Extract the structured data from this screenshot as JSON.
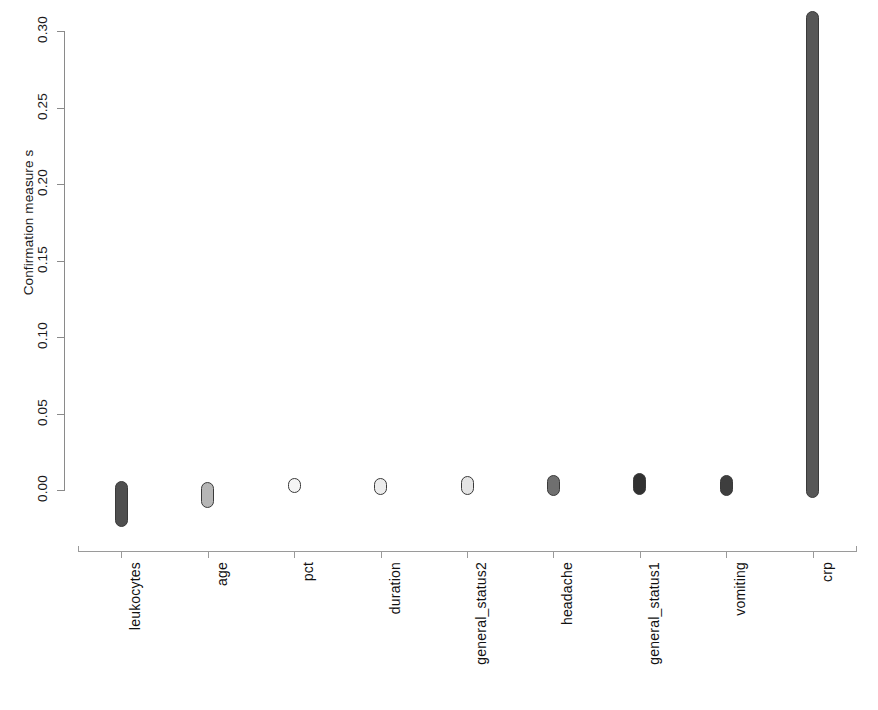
{
  "chart_data": {
    "type": "bar",
    "title": "",
    "subtitle": "",
    "xlabel": "",
    "ylabel": "Confirmation measure s",
    "orientation": "vertical",
    "grid": false,
    "legend": "none",
    "ylim": [
      -0.035,
      0.32
    ],
    "yticks": [
      "0.00",
      "0.05",
      "0.10",
      "0.15",
      "0.20",
      "0.25",
      "0.30"
    ],
    "ytick_values": [
      0.0,
      0.05,
      0.1,
      0.15,
      0.2,
      0.25,
      0.3
    ],
    "categories": [
      "leukocytes",
      "age",
      "pct",
      "duration",
      "general_status2",
      "headache",
      "general_status1",
      "vomiting",
      "crp"
    ],
    "values": [
      -0.024,
      -0.012,
      -0.002,
      -0.003,
      -0.003,
      -0.004,
      -0.003,
      -0.004,
      0.313
    ],
    "bars": [
      {
        "label": "leukocytes",
        "low": -0.024,
        "high": 0.006,
        "fill": "#4f4f4f"
      },
      {
        "label": "age",
        "low": -0.012,
        "high": 0.005,
        "fill": "#b6b6b6"
      },
      {
        "label": "pct",
        "low": -0.002,
        "high": 0.008,
        "fill": "#f4f4f4"
      },
      {
        "label": "duration",
        "low": -0.003,
        "high": 0.008,
        "fill": "#ececec"
      },
      {
        "label": "general_status2",
        "low": -0.003,
        "high": 0.009,
        "fill": "#e4e4e4"
      },
      {
        "label": "headache",
        "low": -0.004,
        "high": 0.01,
        "fill": "#6f6f6f"
      },
      {
        "label": "general_status1",
        "low": -0.003,
        "high": 0.011,
        "fill": "#313131"
      },
      {
        "label": "vomiting",
        "low": -0.004,
        "high": 0.01,
        "fill": "#3e3e3e"
      },
      {
        "label": "crp",
        "low": -0.005,
        "high": 0.313,
        "fill": "#575757"
      }
    ],
    "axis_color": "#8a8a8a",
    "bar_outline_color": "#3a3a3a",
    "background_color": "#ffffff"
  }
}
